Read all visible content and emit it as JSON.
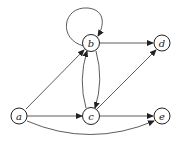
{
  "diagram": {
    "type": "directed-graph",
    "nodes": [
      {
        "id": "a",
        "label": "a",
        "x": 19,
        "y": 116
      },
      {
        "id": "b",
        "label": "b",
        "x": 91,
        "y": 43
      },
      {
        "id": "c",
        "label": "c",
        "x": 91,
        "y": 116
      },
      {
        "id": "d",
        "label": "d",
        "x": 162,
        "y": 43
      },
      {
        "id": "e",
        "label": "e",
        "x": 162,
        "y": 116
      }
    ],
    "edges": [
      {
        "from": "a",
        "to": "b"
      },
      {
        "from": "a",
        "to": "c"
      },
      {
        "from": "a",
        "to": "e"
      },
      {
        "from": "b",
        "to": "b"
      },
      {
        "from": "b",
        "to": "c"
      },
      {
        "from": "c",
        "to": "b"
      },
      {
        "from": "b",
        "to": "d"
      },
      {
        "from": "c",
        "to": "d"
      },
      {
        "from": "c",
        "to": "e"
      }
    ]
  }
}
